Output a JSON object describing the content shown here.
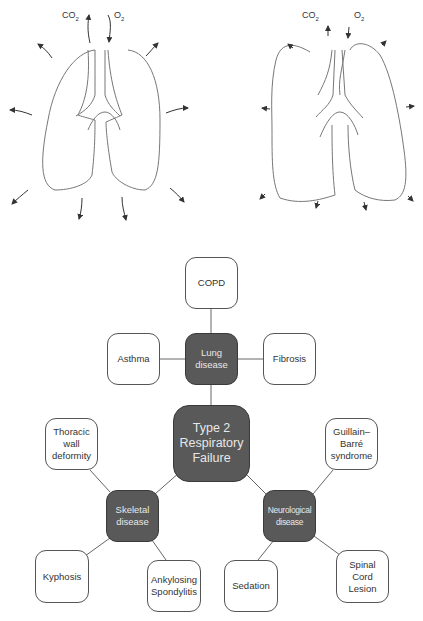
{
  "lungs": {
    "left": {
      "co2_label": "CO",
      "co2_sub": "2",
      "o2_label": "O",
      "o2_sub": "2",
      "state": "normal expansion"
    },
    "right": {
      "co2_label": "CO",
      "co2_sub": "2",
      "o2_label": "O",
      "o2_sub": "2",
      "state": "reduced expansion"
    }
  },
  "diagram": {
    "center": {
      "label": "Type 2 Respiratory Failure"
    },
    "categories": [
      {
        "id": "lung",
        "label": "Lung disease",
        "children": [
          "COPD",
          "Asthma",
          "Fibrosis"
        ]
      },
      {
        "id": "skeletal",
        "label": "Skeletal disease",
        "children": [
          "Thoracic wall deformity",
          "Kyphosis",
          "Ankylosing Spondylitis"
        ]
      },
      {
        "id": "neuro",
        "label": "Neurological disease",
        "children": [
          "Guillain–Barré syndrome",
          "Sedation",
          "Spinal Cord Lesion"
        ]
      }
    ]
  },
  "colors": {
    "dark_node": "#595959",
    "stroke": "#555555"
  }
}
